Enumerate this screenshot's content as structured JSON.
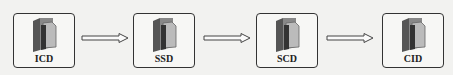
{
  "diagram": {
    "nodes": [
      {
        "label": "ICD",
        "icon": "folder-icon"
      },
      {
        "label": "SSD",
        "icon": "folder-icon"
      },
      {
        "label": "SCD",
        "icon": "folder-icon"
      },
      {
        "label": "CID",
        "icon": "folder-icon"
      }
    ],
    "edges": [
      {
        "from": "ICD",
        "to": "SSD"
      },
      {
        "from": "SSD",
        "to": "SCD"
      },
      {
        "from": "SCD",
        "to": "CID"
      }
    ]
  }
}
